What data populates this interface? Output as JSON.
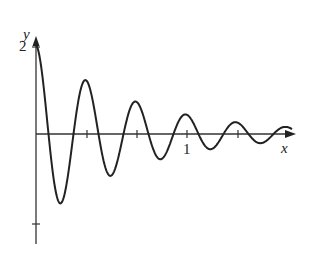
{
  "chart_data": {
    "type": "line",
    "title": "",
    "xlabel": "x",
    "ylabel": "y",
    "function_description": "Damped oscillation starting at y=2 at x=0, decaying amplitude with period 1/3",
    "x_ticks": [
      0.3333,
      0.6667,
      1,
      1.3333
    ],
    "x_tick_labels": [
      "",
      "",
      "1",
      ""
    ],
    "y_ticks": [
      2,
      -2
    ],
    "y_tick_labels": [
      "2",
      ""
    ],
    "xlim": [
      0,
      1.67
    ],
    "ylim": [
      -2.5,
      2.2
    ],
    "grid": false,
    "legend": null,
    "x": [
      0,
      0.167,
      0.333,
      0.5,
      0.667,
      0.833,
      1.0,
      1.167,
      1.333,
      1.5
    ],
    "values": [
      2.0,
      -1.6,
      1.23,
      -0.95,
      0.73,
      -0.56,
      0.44,
      -0.33,
      0.26,
      -0.2
    ]
  },
  "labels": {
    "y_axis": "y",
    "x_axis": "x",
    "y_tick_2": "2",
    "x_tick_1": "1"
  }
}
